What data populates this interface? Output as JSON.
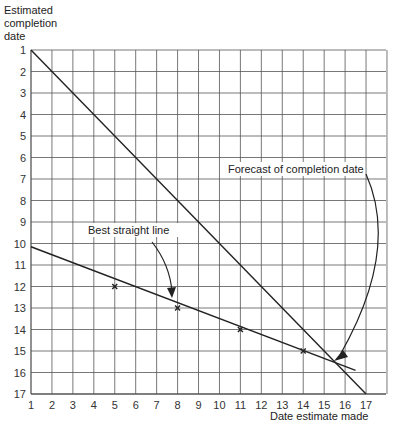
{
  "chart_data": {
    "type": "line",
    "title": "",
    "xlabel": "Date estimate made",
    "ylabel": "Estimated completion date",
    "xlim": [
      1,
      17
    ],
    "ylim": [
      1,
      17
    ],
    "y_inverted": true,
    "grid": true,
    "x_ticks": [
      1,
      2,
      3,
      4,
      5,
      6,
      7,
      8,
      9,
      10,
      11,
      12,
      13,
      14,
      15,
      16,
      17
    ],
    "y_ticks": [
      1,
      2,
      3,
      4,
      5,
      6,
      7,
      8,
      9,
      10,
      11,
      12,
      13,
      14,
      15,
      16,
      17
    ],
    "series": [
      {
        "name": "Estimates",
        "kind": "scatter",
        "marker": "x",
        "points": [
          [
            5,
            12
          ],
          [
            8,
            13
          ],
          [
            11,
            14
          ],
          [
            14,
            15
          ]
        ]
      },
      {
        "name": "Best straight line",
        "kind": "line",
        "points": [
          [
            1,
            10.15
          ],
          [
            16.5,
            15.9
          ]
        ]
      },
      {
        "name": "Estimate equals date (diagonal)",
        "kind": "line",
        "points": [
          [
            1,
            1
          ],
          [
            17,
            17
          ]
        ]
      }
    ],
    "annotations": [
      {
        "text": "Best straight line",
        "points_to": [
          8,
          13
        ]
      },
      {
        "text": "Forecast of completion date",
        "points_to": [
          15.7,
          15.7
        ]
      }
    ]
  },
  "labels": {
    "y_axis_line1": "Estimated",
    "y_axis_line2": "completion",
    "y_axis_line3": "date",
    "x_axis": "Date estimate made",
    "annotation_best_line": "Best straight line",
    "annotation_forecast": "Forecast of completion date"
  }
}
